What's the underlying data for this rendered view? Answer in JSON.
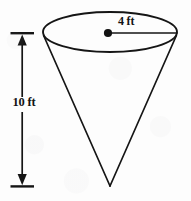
{
  "figure": {
    "name": "cone-with-dimensions",
    "stroke_color": "#151515",
    "background_color": "#fdfdfd"
  },
  "labels": {
    "radius": "4 ft",
    "height": "10 ft"
  },
  "geometry": {
    "ellipse": {
      "cx": 110,
      "cy": 32,
      "rx": 67,
      "ry": 20
    },
    "apex": {
      "x": 110,
      "y": 186
    },
    "center_dot": {
      "cx": 108,
      "cy": 33,
      "r": 4
    },
    "radius_line": {
      "x1": 108,
      "y1": 33,
      "x2": 177,
      "y2": 33
    },
    "height_arrow": {
      "x": 22,
      "y_top": 34,
      "y_bottom": 185,
      "tick_left": 10,
      "tick_right": 34
    }
  }
}
